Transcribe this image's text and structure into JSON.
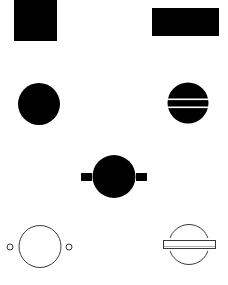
{
  "canvas": {
    "width": 228,
    "height": 285,
    "background": "#ffffff"
  },
  "colors": {
    "fill": "#000000",
    "stroke": "#3a3a3a",
    "gap": "#ffffff"
  },
  "shapes": [
    {
      "name": "filled-square",
      "type": "rect",
      "x": 14,
      "y": 0,
      "width": 43,
      "height": 41
    },
    {
      "name": "filled-wide-rectangle",
      "type": "rect",
      "x": 152,
      "y": 8,
      "width": 67,
      "height": 28
    },
    {
      "name": "filled-circle",
      "type": "circle",
      "cx": 39,
      "cy": 104,
      "r": 21
    },
    {
      "name": "filled-circle-with-stripes",
      "type": "circle",
      "cx": 188,
      "cy": 103,
      "r": 20.5,
      "stripes": [
        {
          "y": 98.5,
          "height": 1.6
        },
        {
          "y": 106.5,
          "height": 1.6
        }
      ]
    },
    {
      "name": "filled-circle-with-side-tabs",
      "type": "circle",
      "cx": 114,
      "cy": 176.5,
      "r": 21.5,
      "tabs": [
        {
          "x": 81,
          "y": 173,
          "width": 11,
          "height": 8
        },
        {
          "x": 136,
          "y": 173,
          "width": 11,
          "height": 8
        }
      ]
    },
    {
      "name": "outline-circle-with-side-dots",
      "type": "circle-outline",
      "cx": 40,
      "cy": 246.5,
      "r": 21,
      "dots": [
        {
          "cx": 10,
          "cy": 247,
          "r": 3
        },
        {
          "cx": 69,
          "cy": 247,
          "r": 3
        }
      ]
    },
    {
      "name": "outline-circle-with-crossbar",
      "type": "circle-outline",
      "cx": 189,
      "cy": 244.5,
      "r": 20,
      "bar": {
        "x": 163,
        "y": 240,
        "width": 53,
        "height": 9,
        "gap": 2
      }
    }
  ]
}
